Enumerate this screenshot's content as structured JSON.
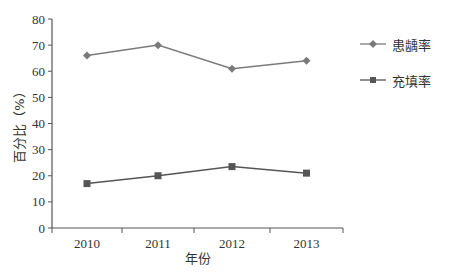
{
  "chart_data": {
    "type": "line",
    "title": "",
    "xlabel": "年份",
    "ylabel": "百分比（%）",
    "categories": [
      "2010",
      "2011",
      "2012",
      "2013"
    ],
    "series": [
      {
        "name": "患龋率",
        "marker": "diamond",
        "color": "#7a7a7a",
        "values": [
          66,
          70,
          61,
          64
        ]
      },
      {
        "name": "充填率",
        "marker": "square",
        "color": "#555555",
        "values": [
          17,
          20,
          23.5,
          21
        ]
      }
    ],
    "ylim": [
      0,
      80
    ],
    "yticks": [
      0,
      10,
      20,
      30,
      40,
      50,
      60,
      70,
      80
    ],
    "grid": false,
    "legend_position": "right"
  },
  "legend": {
    "items": [
      {
        "label": "患龋率"
      },
      {
        "label": "充填率"
      }
    ]
  }
}
